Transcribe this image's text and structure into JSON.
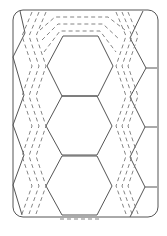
{
  "diagram": {
    "type": "quilt-block-pattern",
    "colors": {
      "background": "#ffffff",
      "line": "#555555",
      "dash": "#777777"
    },
    "border": {
      "x": 13,
      "y": 10,
      "width": 145,
      "height": 207,
      "radius": 10
    },
    "hexagons": [
      {
        "name": "top",
        "points": "63,36 98,36 113,66 98,96 62,96 47,66"
      },
      {
        "name": "middle",
        "points": "62,96 97,96 112,126 97,155 62,155 46,126"
      },
      {
        "name": "bottom",
        "points": "62,156 97,156 112,186 97,215 62,215 46,186"
      }
    ],
    "left_zigzag": "20,11 25,33 13,57 24,95 13,125 24,155 13,185 22,215",
    "right_zigzag": "143,11 130,38 146,68 130,97 145,127 130,157 145,187 130,217",
    "right_connectors": [
      {
        "x1": 146,
        "y1": 68,
        "x2": 157,
        "y2": 68
      },
      {
        "x1": 145,
        "y1": 127,
        "x2": 157,
        "y2": 127
      },
      {
        "x1": 145,
        "y1": 187,
        "x2": 157,
        "y2": 187
      }
    ],
    "dashed_outlines_top": [
      "40,30 55,17 108,17 125,30",
      "42,40 58,24 103,24 120,40",
      "44,52 60,31 100,31 116,52"
    ],
    "dashed_outline_bottom": "60,219 100,219"
  }
}
